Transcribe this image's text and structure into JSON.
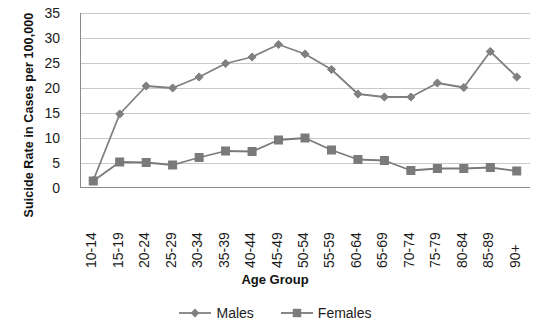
{
  "chart_data": {
    "type": "line",
    "title": "",
    "xlabel": "Age Group",
    "ylabel": "Suicide Rate  in Cases per 100,000",
    "categories": [
      "10-14",
      "15-19",
      "20-24",
      "25-29",
      "30-34",
      "35-39",
      "40-44",
      "45-49",
      "50-54",
      "55-59",
      "60-64",
      "65-69",
      "70-74",
      "75-79",
      "80-84",
      "85-89",
      "90+"
    ],
    "ylim": [
      0,
      35
    ],
    "yticks": [
      0,
      5,
      10,
      15,
      20,
      25,
      30,
      35
    ],
    "ytick_labels": [
      "0",
      "5",
      "10",
      "15",
      "20",
      "25",
      "30",
      "35"
    ],
    "grid": "horizontal",
    "legend_position": "bottom",
    "series": [
      {
        "name": "Males",
        "marker": "diamond",
        "color": "#808080",
        "values": [
          1.5,
          14.8,
          20.4,
          20.0,
          22.2,
          24.9,
          26.2,
          28.7,
          26.8,
          23.7,
          18.8,
          18.2,
          18.2,
          21.0,
          20.1,
          27.3,
          22.2
        ]
      },
      {
        "name": "Females",
        "marker": "square",
        "color": "#7a7a7a",
        "values": [
          1.4,
          5.2,
          5.1,
          4.6,
          6.1,
          7.4,
          7.3,
          9.6,
          10.0,
          7.6,
          5.7,
          5.5,
          3.5,
          3.9,
          3.9,
          4.1,
          3.4
        ]
      }
    ]
  },
  "legend": {
    "items": [
      {
        "label": "Males",
        "marker": "diamond-marker",
        "color": "#808080"
      },
      {
        "label": "Females",
        "marker": "square-marker",
        "color": "#7a7a7a"
      }
    ]
  },
  "axis": {
    "x_title": "Age Group",
    "y_title": "Suicide Rate  in Cases per 100,000"
  },
  "colors": {
    "males": "#808080",
    "females": "#7a7a7a",
    "gridline": "#c9c9c9",
    "axis": "#8a8a8a",
    "text": "#1b1b1b"
  }
}
